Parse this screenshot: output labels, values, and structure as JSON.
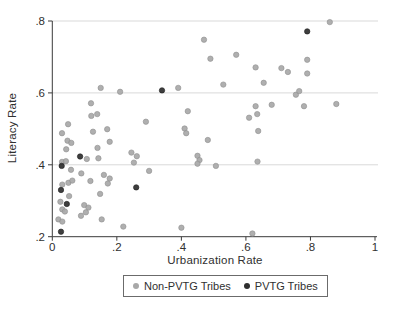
{
  "chart_data": {
    "type": "scatter",
    "title": "",
    "xlabel": "Urbanization Rate",
    "ylabel": "Literacy Rate",
    "xlim": [
      0,
      1
    ],
    "ylim": [
      0.2,
      0.8
    ],
    "x_tick_values": [
      0,
      0.2,
      0.4,
      0.6,
      0.8,
      1
    ],
    "x_tick_labels": [
      "0",
      ".2",
      ".4",
      ".6",
      ".8",
      "1"
    ],
    "y_tick_values": [
      0.2,
      0.4,
      0.6,
      0.8
    ],
    "y_tick_labels": [
      ".2",
      ".4",
      ".6",
      ".8"
    ],
    "grid": "horizontal-only",
    "gridline_color": "#d9d9d9",
    "axis_color": "#3a3a3a",
    "text_color": "#303030",
    "legend_position": "bottom-center",
    "series": [
      {
        "name": "Non-PVTG Tribes",
        "color": "#a8a8a8",
        "stroke": "#8e8e8e",
        "points": [
          [
            0.86,
            0.797
          ],
          [
            0.47,
            0.748
          ],
          [
            0.57,
            0.706
          ],
          [
            0.49,
            0.695
          ],
          [
            0.79,
            0.692
          ],
          [
            0.71,
            0.669
          ],
          [
            0.63,
            0.671
          ],
          [
            0.73,
            0.658
          ],
          [
            0.79,
            0.654
          ],
          [
            0.655,
            0.628
          ],
          [
            0.53,
            0.623
          ],
          [
            0.15,
            0.614
          ],
          [
            0.39,
            0.614
          ],
          [
            0.21,
            0.603
          ],
          [
            0.755,
            0.595
          ],
          [
            0.765,
            0.605
          ],
          [
            0.68,
            0.567
          ],
          [
            0.78,
            0.563
          ],
          [
            0.88,
            0.569
          ],
          [
            0.12,
            0.571
          ],
          [
            0.42,
            0.549
          ],
          [
            0.63,
            0.563
          ],
          [
            0.61,
            0.531
          ],
          [
            0.635,
            0.541
          ],
          [
            0.121,
            0.536
          ],
          [
            0.139,
            0.541
          ],
          [
            0.29,
            0.52
          ],
          [
            0.17,
            0.499
          ],
          [
            0.049,
            0.513
          ],
          [
            0.03,
            0.488
          ],
          [
            0.41,
            0.501
          ],
          [
            0.415,
            0.488
          ],
          [
            0.638,
            0.494
          ],
          [
            0.482,
            0.469
          ],
          [
            0.047,
            0.467
          ],
          [
            0.126,
            0.492
          ],
          [
            0.059,
            0.461
          ],
          [
            0.14,
            0.447
          ],
          [
            0.178,
            0.464
          ],
          [
            0.043,
            0.443
          ],
          [
            0.245,
            0.434
          ],
          [
            0.262,
            0.424
          ],
          [
            0.253,
            0.406
          ],
          [
            0.45,
            0.425
          ],
          [
            0.456,
            0.413
          ],
          [
            0.45,
            0.403
          ],
          [
            0.507,
            0.397
          ],
          [
            0.636,
            0.409
          ],
          [
            0.107,
            0.416
          ],
          [
            0.143,
            0.418
          ],
          [
            0.03,
            0.408
          ],
          [
            0.042,
            0.41
          ],
          [
            0.058,
            0.386
          ],
          [
            0.09,
            0.376
          ],
          [
            0.16,
            0.372
          ],
          [
            0.178,
            0.362
          ],
          [
            0.118,
            0.355
          ],
          [
            0.172,
            0.348
          ],
          [
            0.3,
            0.383
          ],
          [
            0.05,
            0.35
          ],
          [
            0.062,
            0.356
          ],
          [
            0.031,
            0.345
          ],
          [
            0.052,
            0.313
          ],
          [
            0.148,
            0.319
          ],
          [
            0.099,
            0.288
          ],
          [
            0.112,
            0.281
          ],
          [
            0.104,
            0.268
          ],
          [
            0.031,
            0.276
          ],
          [
            0.039,
            0.27
          ],
          [
            0.089,
            0.258
          ],
          [
            0.019,
            0.248
          ],
          [
            0.031,
            0.242
          ],
          [
            0.153,
            0.248
          ],
          [
            0.025,
            0.297
          ],
          [
            0.22,
            0.228
          ],
          [
            0.4,
            0.225
          ],
          [
            0.62,
            0.209
          ]
        ]
      },
      {
        "name": "PVTG Tribes",
        "color": "#2e2e2e",
        "stroke": "#1c1c1c",
        "points": [
          [
            0.79,
            0.771
          ],
          [
            0.34,
            0.607
          ],
          [
            0.086,
            0.423
          ],
          [
            0.029,
            0.397
          ],
          [
            0.26,
            0.337
          ],
          [
            0.027,
            0.33
          ],
          [
            0.045,
            0.291
          ],
          [
            0.027,
            0.214
          ]
        ]
      }
    ]
  },
  "legend": {
    "items": [
      {
        "label": "Non-PVTG Tribes"
      },
      {
        "label": "PVTG Tribes"
      }
    ]
  }
}
